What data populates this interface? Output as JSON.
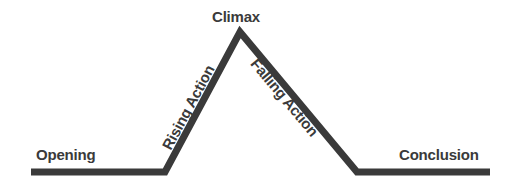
{
  "diagram": {
    "type": "narrative-arc",
    "background_color": "#ffffff",
    "stroke_color": "#3a3a3a",
    "text_color": "#3a3a3a",
    "stroke_width": 7,
    "labels": {
      "opening": "Opening",
      "rising_action": "Rising Action",
      "climax": "Climax",
      "falling_action": "Falling Action",
      "conclusion": "Conclusion"
    },
    "geometry": {
      "baseline_left_start_x": 31,
      "baseline_left_end_x": 165,
      "baseline_right_start_x": 357,
      "baseline_right_end_x": 490,
      "baseline_y": 172,
      "apex_x": 240,
      "apex_y": 32,
      "rising_angle_deg": -61.8,
      "falling_angle_deg": 50.1
    },
    "path": "M 31 172 L 165 172 L 240 32 L 357 172 L 490 172"
  }
}
